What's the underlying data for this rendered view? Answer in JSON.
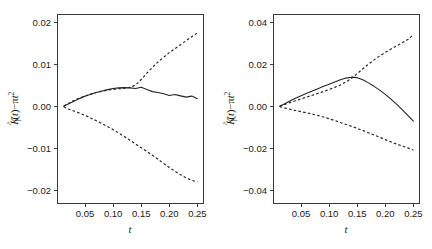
{
  "figure": {
    "width": 432,
    "height": 249,
    "background": "#ffffff",
    "ink_color": "#242424",
    "axis_color": "#3a3a3a"
  },
  "chart_data": [
    {
      "type": "line",
      "panel_id": "left",
      "title": "",
      "xlabel": "t",
      "ylabel": "K_i(t) - pi t^2",
      "ylabel_parts": {
        "k": "K",
        "hat": "^",
        "subscript": "i",
        "open": "(",
        "var": "t",
        "close": ")",
        "minus": "−",
        "pi": "π",
        "t2_base": "t",
        "t2_exp": "2"
      },
      "xlim": [
        0.0,
        0.26
      ],
      "ylim": [
        -0.023,
        0.022
      ],
      "xticks": [
        0.05,
        0.1,
        0.15,
        0.2,
        0.25
      ],
      "xticklabels": [
        "0.05",
        "0.10",
        "0.15",
        "0.20",
        "0.25"
      ],
      "yticks": [
        0.02,
        0.01,
        0.0,
        -0.01,
        -0.02
      ],
      "yticklabels": [
        "0.02",
        "0.01",
        "0.00",
        "−0.01",
        "−0.02"
      ],
      "grid": false,
      "legend": "none",
      "x": [
        0.012,
        0.02,
        0.03,
        0.04,
        0.05,
        0.06,
        0.07,
        0.08,
        0.09,
        0.1,
        0.11,
        0.12,
        0.13,
        0.14,
        0.15,
        0.16,
        0.17,
        0.18,
        0.19,
        0.2,
        0.21,
        0.22,
        0.23,
        0.24,
        0.25
      ],
      "series": [
        {
          "name": "observed",
          "style": "solid",
          "values": [
            5e-05,
            0.00055,
            0.0012,
            0.00185,
            0.0024,
            0.0029,
            0.0033,
            0.00368,
            0.004,
            0.00425,
            0.0044,
            0.00448,
            0.0044,
            0.00425,
            0.00455,
            0.004,
            0.00352,
            0.0033,
            0.003,
            0.00258,
            0.00282,
            0.0025,
            0.0022,
            0.00245,
            0.00185
          ]
        },
        {
          "name": "upper-envelope",
          "style": "dashed",
          "values": [
            0.00012,
            0.0007,
            0.0014,
            0.002,
            0.0025,
            0.00292,
            0.0033,
            0.0036,
            0.00385,
            0.00405,
            0.0042,
            0.00432,
            0.00452,
            0.0051,
            0.0064,
            0.0079,
            0.0093,
            0.0106,
            0.0117,
            0.0128,
            0.01375,
            0.0147,
            0.01565,
            0.0166,
            0.0175
          ]
        },
        {
          "name": "lower-envelope",
          "style": "dashed",
          "values": [
            -0.0001,
            -0.0006,
            -0.0011,
            -0.0016,
            -0.00215,
            -0.00275,
            -0.0034,
            -0.0041,
            -0.0048,
            -0.00555,
            -0.00635,
            -0.00718,
            -0.00805,
            -0.00895,
            -0.00985,
            -0.01075,
            -0.01165,
            -0.0126,
            -0.0136,
            -0.01455,
            -0.01545,
            -0.01625,
            -0.017,
            -0.0176,
            -0.018
          ]
        }
      ]
    },
    {
      "type": "line",
      "panel_id": "right",
      "title": "",
      "xlabel": "t",
      "ylabel": "K_i(t) - pi t^2",
      "ylabel_parts": {
        "k": "K",
        "hat": "^",
        "subscript": "i",
        "open": "(",
        "var": "t",
        "close": ")",
        "minus": "−",
        "pi": "π",
        "t2_base": "t",
        "t2_exp": "2"
      },
      "xlim": [
        0.0,
        0.26
      ],
      "ylim": [
        -0.046,
        0.044
      ],
      "xticks": [
        0.05,
        0.1,
        0.15,
        0.2,
        0.25
      ],
      "xticklabels": [
        "0.05",
        "0.10",
        "0.15",
        "0.20",
        "0.25"
      ],
      "yticks": [
        0.04,
        0.02,
        0.0,
        -0.02,
        -0.04
      ],
      "yticklabels": [
        "0.04",
        "0.02",
        "0.00",
        "−0.02",
        "−0.04"
      ],
      "grid": false,
      "legend": "none",
      "x": [
        0.012,
        0.02,
        0.03,
        0.04,
        0.05,
        0.06,
        0.07,
        0.08,
        0.09,
        0.1,
        0.11,
        0.12,
        0.13,
        0.14,
        0.15,
        0.16,
        0.17,
        0.18,
        0.19,
        0.2,
        0.21,
        0.22,
        0.23,
        0.24,
        0.25
      ],
      "series": [
        {
          "name": "observed",
          "style": "solid",
          "values": [
            0.0001,
            0.0011,
            0.00255,
            0.0039,
            0.0051,
            0.00625,
            0.00735,
            0.00845,
            0.00955,
            0.0106,
            0.01165,
            0.01268,
            0.01348,
            0.01392,
            0.01368,
            0.01268,
            0.0112,
            0.00955,
            0.00775,
            0.00575,
            0.0035,
            0.0011,
            -0.00155,
            -0.0043,
            -0.007
          ]
        },
        {
          "name": "upper-envelope",
          "style": "dashed",
          "values": [
            0.00012,
            0.00085,
            0.0018,
            0.0027,
            0.00358,
            0.00445,
            0.00532,
            0.0062,
            0.0071,
            0.00805,
            0.00905,
            0.0102,
            0.01165,
            0.0134,
            0.0156,
            0.0179,
            0.0201,
            0.02215,
            0.024,
            0.0257,
            0.0273,
            0.0288,
            0.0303,
            0.0318,
            0.0342
          ]
        },
        {
          "name": "lower-envelope",
          "style": "dashed",
          "values": [
            -0.0001,
            -0.0007,
            -0.00135,
            -0.00195,
            -0.0025,
            -0.00305,
            -0.00365,
            -0.0043,
            -0.00505,
            -0.00588,
            -0.00675,
            -0.00765,
            -0.00858,
            -0.00952,
            -0.01048,
            -0.01148,
            -0.01252,
            -0.0136,
            -0.0147,
            -0.01582,
            -0.0169,
            -0.0179,
            -0.01885,
            -0.01975,
            -0.0208
          ]
        }
      ]
    }
  ]
}
